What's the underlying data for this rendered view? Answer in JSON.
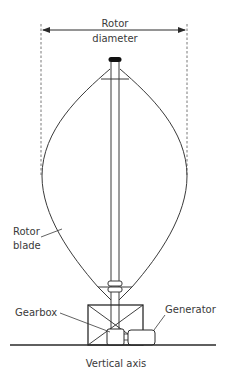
{
  "diagram": {
    "type": "labeled-schematic",
    "caption": "Vertical axis",
    "labels": {
      "rotor_diameter_line1": "Rotor",
      "rotor_diameter_line2": "diameter",
      "rotor_blade_line1": "Rotor",
      "rotor_blade_line2": "blade",
      "gearbox": "Gearbox",
      "generator": "Generator"
    },
    "components": [
      {
        "id": "rotor-diameter-dimension",
        "label": "Rotor diameter"
      },
      {
        "id": "top-bearing-cap",
        "label": ""
      },
      {
        "id": "central-shaft",
        "label": ""
      },
      {
        "id": "rotor-blades",
        "label": "Rotor blade"
      },
      {
        "id": "support-struts",
        "label": ""
      },
      {
        "id": "coupling",
        "label": ""
      },
      {
        "id": "gearbox",
        "label": "Gearbox"
      },
      {
        "id": "generator",
        "label": "Generator"
      },
      {
        "id": "ground-line",
        "label": ""
      }
    ],
    "colors": {
      "stroke": "#3a3a3a",
      "text": "#3a3a3a",
      "background": "#ffffff"
    }
  }
}
